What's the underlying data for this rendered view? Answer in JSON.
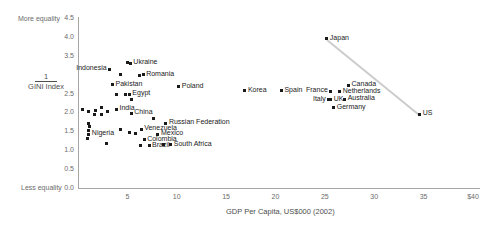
{
  "chart_data": {
    "type": "scatter",
    "title": "",
    "xlabel": "GDP Per Capita, US$000 (2002)",
    "ylabel": "1 / GINI Index",
    "ylabel_parts": {
      "numerator": "1",
      "denominator_line1": "GINI",
      "denominator_line2": "Index"
    },
    "xlim": [
      0,
      40
    ],
    "ylim": [
      0.0,
      4.5
    ],
    "xticks": [
      "5",
      "10",
      "15",
      "20",
      "25",
      "30",
      "35",
      "$40"
    ],
    "xtick_values": [
      5,
      10,
      15,
      20,
      25,
      30,
      35,
      40
    ],
    "yticks": [
      "0.0",
      "0.5",
      "1.0",
      "1.5",
      "2.0",
      "2.5",
      "3.5",
      "4.0",
      "4.5"
    ],
    "ytick_values": [
      0.0,
      0.5,
      1.0,
      1.5,
      2.0,
      2.5,
      3.5,
      4.0,
      4.5
    ],
    "grid": false,
    "legend": null,
    "axis_annotations": {
      "y_top": "More equality",
      "y_bottom": "Less equality"
    },
    "trendline": {
      "x_start": 25.2,
      "y_start": 3.95,
      "x_end": 34.6,
      "y_end": 1.95,
      "color": "#cccccc"
    },
    "points": [
      {
        "label": "Indonesia",
        "x": 3.2,
        "y": 3.15,
        "label_pos": "left"
      },
      {
        "label": "Ukraine",
        "x": 5.3,
        "y": 3.3,
        "label_pos": "right"
      },
      {
        "label": "Romania",
        "x": 6.6,
        "y": 3.0,
        "label_pos": "right"
      },
      {
        "label": "Poland",
        "x": 10.2,
        "y": 2.68,
        "label_pos": "right"
      },
      {
        "label": "Pakistan",
        "x": 3.5,
        "y": 2.73,
        "label_pos": "right"
      },
      {
        "label": "Egypt",
        "x": 5.2,
        "y": 2.48,
        "label_pos": "right"
      },
      {
        "label": "India",
        "x": 3.9,
        "y": 2.08,
        "label_pos": "right"
      },
      {
        "label": "China",
        "x": 5.4,
        "y": 1.98,
        "label_pos": "right"
      },
      {
        "label": "Nigeria",
        "x": 1.1,
        "y": 1.42,
        "label_pos": "right"
      },
      {
        "label": "Venezuela",
        "x": 6.4,
        "y": 1.55,
        "label_pos": "right"
      },
      {
        "label": "Russian Federation",
        "x": 8.9,
        "y": 1.72,
        "label_pos": "right"
      },
      {
        "label": "Mexico",
        "x": 8.1,
        "y": 1.42,
        "label_pos": "right"
      },
      {
        "label": "Colombia",
        "x": 6.7,
        "y": 1.28,
        "label_pos": "right"
      },
      {
        "label": "Brazil",
        "x": 7.2,
        "y": 1.12,
        "label_pos": "right"
      },
      {
        "label": "South Africa",
        "x": 9.4,
        "y": 1.15,
        "label_pos": "right"
      },
      {
        "label": "Korea",
        "x": 16.9,
        "y": 2.58,
        "label_pos": "right"
      },
      {
        "label": "Spain",
        "x": 20.6,
        "y": 2.58,
        "label_pos": "right"
      },
      {
        "label": "France",
        "x": 25.6,
        "y": 2.56,
        "label_pos": "left"
      },
      {
        "label": "Japan",
        "x": 25.2,
        "y": 3.95,
        "label_pos": "right"
      },
      {
        "label": "Canada",
        "x": 27.4,
        "y": 2.72,
        "label_pos": "right"
      },
      {
        "label": "Netherlands",
        "x": 26.5,
        "y": 2.55,
        "label_pos": "right"
      },
      {
        "label": "Australia",
        "x": 27.0,
        "y": 2.35,
        "label_pos": "right"
      },
      {
        "label": "UK",
        "x": 25.6,
        "y": 2.33,
        "label_pos": "right"
      },
      {
        "label": "Italy",
        "x": 25.4,
        "y": 2.33,
        "label_pos": "left"
      },
      {
        "label": "Germany",
        "x": 25.9,
        "y": 2.12,
        "label_pos": "right"
      },
      {
        "label": "US",
        "x": 34.6,
        "y": 1.95,
        "label_pos": "right"
      }
    ],
    "unlabeled_points": [
      {
        "x": 0.45,
        "y": 2.08
      },
      {
        "x": 1.1,
        "y": 2.02
      },
      {
        "x": 1.75,
        "y": 2.05
      },
      {
        "x": 2.4,
        "y": 2.12
      },
      {
        "x": 3.0,
        "y": 2.02
      },
      {
        "x": 1.7,
        "y": 1.95
      },
      {
        "x": 2.4,
        "y": 1.95
      },
      {
        "x": 1.05,
        "y": 1.72
      },
      {
        "x": 1.15,
        "y": 1.62
      },
      {
        "x": 1.05,
        "y": 1.52
      },
      {
        "x": 1.05,
        "y": 1.42
      },
      {
        "x": 0.95,
        "y": 1.32
      },
      {
        "x": 4.3,
        "y": 1.55
      },
      {
        "x": 5.2,
        "y": 1.48
      },
      {
        "x": 5.85,
        "y": 1.45
      },
      {
        "x": 7.6,
        "y": 1.85
      },
      {
        "x": 3.9,
        "y": 2.47
      },
      {
        "x": 4.85,
        "y": 2.48
      },
      {
        "x": 4.3,
        "y": 3.0
      },
      {
        "x": 5.0,
        "y": 3.33
      },
      {
        "x": 6.2,
        "y": 2.98
      },
      {
        "x": 5.4,
        "y": 2.35
      },
      {
        "x": 6.3,
        "y": 1.12
      },
      {
        "x": 8.7,
        "y": 1.15
      },
      {
        "x": 2.9,
        "y": 1.18
      }
    ]
  }
}
